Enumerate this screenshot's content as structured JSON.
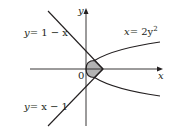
{
  "figure": {
    "type": "region-between-curves",
    "axes": {
      "x_label": "x",
      "y_label": "y",
      "origin_label": "0"
    },
    "curves": [
      {
        "id": "line-top",
        "equation": "y = 1 − x",
        "label": "y = 1 − x"
      },
      {
        "id": "line-bottom",
        "equation": "y = x − 1",
        "label": "y = x − 1"
      },
      {
        "id": "parabola",
        "equation": "x = 2y²",
        "label": "x = 2y²"
      }
    ],
    "shaded_region": {
      "description": "Region bounded by x = 2y², y = 1 − x, and y = x − 1",
      "vertices": [
        [
          0,
          0
        ],
        [
          0.5,
          0.5
        ],
        [
          1,
          0
        ],
        [
          0.5,
          -0.5
        ]
      ],
      "fill": "#b3b3b3"
    },
    "colors": {
      "stroke": "#231f20",
      "shade": "#b3b3b3",
      "background": "#ffffff"
    }
  },
  "labels": {
    "y_axis": "y",
    "x_axis": "x",
    "origin": "0",
    "line_top_lhs": "y",
    "line_top_rhs": "= 1 − x",
    "parabola_lhs": "x",
    "parabola_mid": "= 2y",
    "parabola_exp": "2",
    "line_bottom_lhs": "y",
    "line_bottom_rhs": "= x − 1"
  }
}
